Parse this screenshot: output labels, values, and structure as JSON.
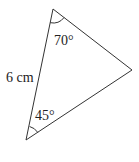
{
  "diagram": {
    "type": "triangle",
    "vertices": {
      "top": [
        53,
        9
      ],
      "right": [
        132,
        70
      ],
      "bottom": [
        26,
        140
      ]
    },
    "angles": {
      "top": "70°",
      "bottom": "45°"
    },
    "side_labels": {
      "left": "6 cm"
    },
    "stroke_color": "#333333"
  }
}
